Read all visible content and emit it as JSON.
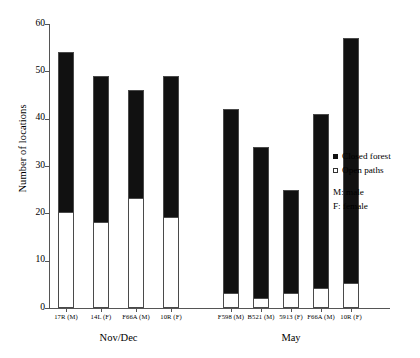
{
  "chart_data": {
    "type": "bar",
    "subtype": "stacked-bar-grouped",
    "title": "",
    "xlabel": "",
    "ylabel": "Number of locations",
    "ylim": [
      0,
      60
    ],
    "ytick_values": [
      0,
      10,
      20,
      30,
      40,
      50,
      60
    ],
    "ytick_labels": [
      "0",
      "10",
      "20",
      "30",
      "40",
      "50",
      "60"
    ],
    "grid": false,
    "legend_position": "right",
    "series": [
      {
        "name": "Closed forest",
        "color": "#111111",
        "values": [
          34,
          31,
          23,
          30,
          39,
          32,
          22,
          37,
          52
        ]
      },
      {
        "name": "Open paths",
        "color": "#ffffff",
        "values": [
          20,
          18,
          23,
          19,
          3,
          2,
          3,
          4,
          5
        ]
      }
    ],
    "categories": [
      "17R (M)",
      "14L (F)",
      "F66A (M)",
      "10R (F)",
      "F598 (M)",
      "B521 (M)",
      "5913 (F)",
      "F66A (M)",
      "10R (F)"
    ],
    "totals": [
      54,
      49,
      46,
      49,
      42,
      34,
      25,
      41,
      57
    ],
    "groups": [
      {
        "label": "Nov/Dec",
        "categories": [
          "17R (M)",
          "14L (F)",
          "F66A (M)",
          "10R (F)"
        ]
      },
      {
        "label": "May",
        "categories": [
          "F598 (M)",
          "B521 (M)",
          "5913 (F)",
          "F66A (M)",
          "10R (F)"
        ]
      }
    ],
    "annotations": [
      "M: male",
      "F: female"
    ]
  },
  "axis": {
    "y_title": "Number of locations",
    "y_ticks": [
      "0",
      "10",
      "20",
      "30",
      "40",
      "50",
      "60"
    ]
  },
  "bars": [
    {
      "label": "17R (M)",
      "total": 54,
      "closed": 34,
      "open": 20,
      "group": "Nov/Dec"
    },
    {
      "label": "14L (F)",
      "total": 49,
      "closed": 31,
      "open": 18,
      "group": "Nov/Dec"
    },
    {
      "label": "F66A (M)",
      "total": 46,
      "closed": 23,
      "open": 23,
      "group": "Nov/Dec"
    },
    {
      "label": "10R (F)",
      "total": 49,
      "closed": 30,
      "open": 19,
      "group": "Nov/Dec"
    },
    {
      "label": "F598 (M)",
      "total": 42,
      "closed": 39,
      "open": 3,
      "group": "May"
    },
    {
      "label": "B521 (M)",
      "total": 34,
      "closed": 32,
      "open": 2,
      "group": "May"
    },
    {
      "label": "5913 (F)",
      "total": 25,
      "closed": 22,
      "open": 3,
      "group": "May"
    },
    {
      "label": "F66A (M)",
      "total": 41,
      "closed": 37,
      "open": 4,
      "group": "May"
    },
    {
      "label": "10R (F)",
      "total": 57,
      "closed": 52,
      "open": 5,
      "group": "May"
    }
  ],
  "groups": [
    {
      "label": "Nov/Dec"
    },
    {
      "label": "May"
    }
  ],
  "legend": {
    "items": [
      {
        "label": "Closed forest",
        "swatch": "filled-square-icon",
        "color": "#111111"
      },
      {
        "label": "Open paths",
        "swatch": "hollow-square-icon",
        "color": "#ffffff"
      }
    ],
    "notes": [
      {
        "text": "M: male"
      },
      {
        "text": "F: female"
      }
    ]
  }
}
